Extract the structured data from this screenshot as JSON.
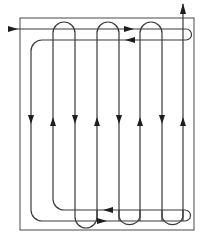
{
  "diagram": {
    "type": "serpentine-flow-path",
    "colors": {
      "line": "#3a3a3a",
      "frame": "#5a5a5a",
      "arrow": "#1e1e1e",
      "background": "#ffffff"
    },
    "entry_arrow": "arrow-right",
    "exit_arrow": "arrow-up",
    "vertical_passes": [
      {
        "index": 1,
        "direction": "down"
      },
      {
        "index": 2,
        "direction": "up"
      },
      {
        "index": 3,
        "direction": "down"
      },
      {
        "index": 4,
        "direction": "up"
      },
      {
        "index": 5,
        "direction": "down"
      },
      {
        "index": 6,
        "direction": "up"
      },
      {
        "index": 7,
        "direction": "down"
      },
      {
        "index": 8,
        "direction": "up"
      }
    ],
    "top_horizontal_arrows": [
      "right",
      "left"
    ],
    "bottom_horizontal_arrows": [
      "left",
      "right"
    ]
  }
}
